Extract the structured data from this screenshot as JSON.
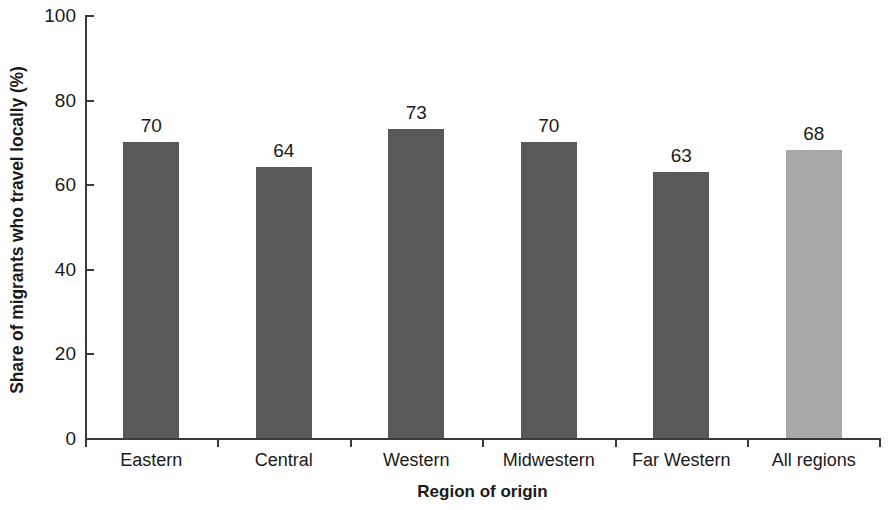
{
  "chart_data": {
    "type": "bar",
    "title": "",
    "subtitle": "",
    "xlabel": "Region of origin",
    "ylabel": "Share of migrants who travel locally (%)",
    "categories": [
      "Eastern",
      "Central",
      "Western",
      "Midwestern",
      "Far Western",
      "All regions"
    ],
    "values": [
      70,
      64,
      73,
      70,
      63,
      68
    ],
    "value_labels": [
      "70",
      "64",
      "73",
      "70",
      "63",
      "68"
    ],
    "ylim": [
      0,
      100
    ],
    "yticks": [
      0,
      20,
      40,
      60,
      80,
      100
    ],
    "ytick_labels": [
      "0",
      "20",
      "40",
      "60",
      "80",
      "100"
    ],
    "grid": false,
    "legend": null,
    "bar_colors": [
      "#595959",
      "#595959",
      "#595959",
      "#595959",
      "#595959",
      "#a8a8a8"
    ],
    "colors": {
      "bar_dark": "#595959",
      "bar_light": "#a8a8a8",
      "axis": "#3a3a3a",
      "text": "#1a1a1a",
      "background": "#ffffff"
    }
  }
}
